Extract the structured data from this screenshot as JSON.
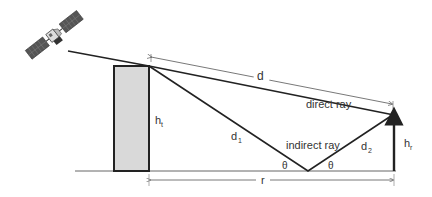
{
  "diagram": {
    "type": "two-ray propagation geometry",
    "labels": {
      "d": "d",
      "direct_ray": "direct ray",
      "indirect_ray": "indirect ray",
      "d1": "d",
      "d1_sub": "1",
      "d2": "d",
      "d2_sub": "2",
      "ht": "h",
      "ht_sub": "t",
      "hr": "h",
      "hr_sub": "r",
      "theta_left": "θ",
      "theta_right": "θ",
      "r": "r"
    },
    "colors": {
      "line": "#222222",
      "building_fill": "#d9d9d9",
      "ground": "#555555",
      "text": "#333333"
    }
  }
}
